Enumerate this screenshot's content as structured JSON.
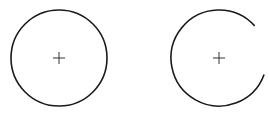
{
  "diagram": {
    "shapes": [
      {
        "name": "full-circle",
        "type": "circle",
        "center_marker": "+"
      },
      {
        "name": "open-arc",
        "type": "arc",
        "gap_side": "right",
        "center_marker": "+"
      }
    ],
    "colors": {
      "stroke": "#1a1a1a",
      "marker": "#333333",
      "background": "#ffffff"
    }
  }
}
